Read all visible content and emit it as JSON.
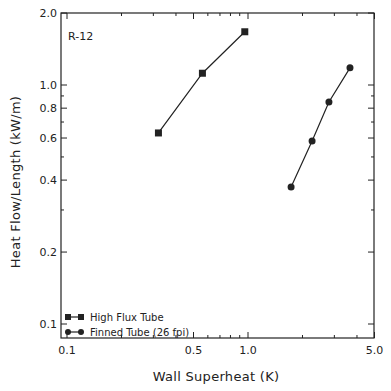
{
  "chart_data": {
    "type": "line",
    "title": "",
    "annotation": "R-12",
    "xlabel": "Wall Superheat (K)",
    "ylabel": "Heat Flow/Length (kW/m)",
    "xscale": "log",
    "yscale": "log",
    "xlim": [
      0.1,
      5.0
    ],
    "ylim": [
      0.09,
      2.0
    ],
    "x_ticks": [
      0.1,
      0.5,
      1.0,
      5.0
    ],
    "x_tick_labels": [
      "0.1",
      "0.5",
      "1.0",
      "5.0"
    ],
    "y_ticks": [
      0.1,
      0.2,
      0.4,
      0.6,
      0.8,
      1.0,
      2.0
    ],
    "y_tick_labels": [
      "0.1",
      "0.2",
      "0.4",
      "0.6",
      "0.8",
      "1.0",
      "2.0"
    ],
    "grid": false,
    "legend_position": "lower left",
    "series": [
      {
        "name": "High Flux Tube",
        "marker": "square",
        "x": [
          0.32,
          0.56,
          0.96
        ],
        "y": [
          0.63,
          1.12,
          1.67
        ]
      },
      {
        "name": "Finned Tube (26 fpi)",
        "marker": "circle",
        "x": [
          1.73,
          2.26,
          2.8,
          3.66
        ],
        "y": [
          0.374,
          0.583,
          0.849,
          1.18
        ]
      }
    ]
  }
}
